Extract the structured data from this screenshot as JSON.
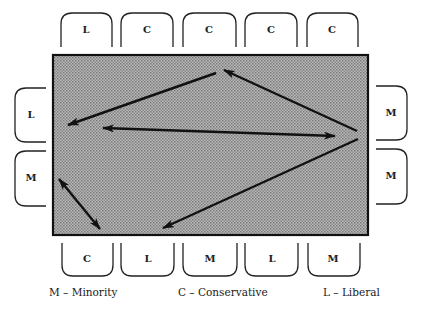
{
  "diagram": {
    "seats": {
      "top": [
        "L",
        "C",
        "C",
        "C",
        "C"
      ],
      "left": [
        "L",
        "M"
      ],
      "right": [
        "M",
        "M"
      ],
      "bottom": [
        "C",
        "L",
        "M",
        "L",
        "M"
      ]
    },
    "arrows": [
      {
        "from": "top seat 3 (C)",
        "to": "left seat 1 (L)",
        "type": "single"
      },
      {
        "from": "left seat 1 (L)",
        "to": "right seat 1 (M)",
        "type": "double"
      },
      {
        "from": "right seat (M)",
        "to": "top seat 3 (C)",
        "type": "single"
      },
      {
        "from": "right seat (M)",
        "to": "bottom seat 2 (L)",
        "type": "single"
      },
      {
        "from": "left seat 2 (M)",
        "to": "bottom seat 1 (C)",
        "type": "double"
      }
    ],
    "colors": {
      "table_fill": "#a9a9a9",
      "table_border": "#111111",
      "arrow": "#111111",
      "seat_outline": "#222222"
    }
  },
  "legend": {
    "minority": "M – Minority",
    "conservative": "C – Conservative",
    "liberal": "L – Liberal"
  }
}
